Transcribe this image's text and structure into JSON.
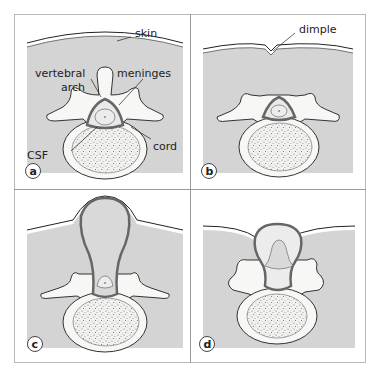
{
  "figure": {
    "colors": {
      "tissue": "#d4d4d4",
      "bone": "#f7f7f5",
      "meninges": "#6a6a6a",
      "outline": "#333333",
      "frame": "#b8b8b8"
    }
  },
  "panels": [
    {
      "id": "a",
      "badge": "a",
      "labels": {
        "skin": "skin",
        "vertebral_arch_1": "vertebral",
        "vertebral_arch_2": "arch",
        "meninges": "meninges",
        "cord": "cord",
        "csf": "CSF"
      }
    },
    {
      "id": "b",
      "badge": "b",
      "labels": {
        "dimple": "dimple"
      }
    },
    {
      "id": "c",
      "badge": "c",
      "labels": {}
    },
    {
      "id": "d",
      "badge": "d",
      "labels": {}
    }
  ]
}
